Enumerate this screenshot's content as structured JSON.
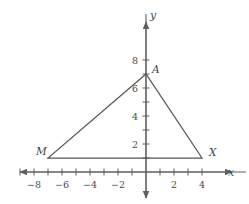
{
  "figure": {
    "axis_x_label": "x",
    "axis_y_label": "y",
    "line_color": "#5f5f5f",
    "shape_color": "#555555",
    "text_color": "#4a4a4a",
    "background": "#ffffff"
  },
  "chart_data": {
    "type": "scatter",
    "title": "",
    "xlabel": "x",
    "ylabel": "y",
    "xlim": [
      -9.5,
      5.5
    ],
    "ylim": [
      -1.5,
      9.5
    ],
    "grid": false,
    "legend": null,
    "x_ticks": [
      -9,
      -8,
      -7,
      -6,
      -5,
      -4,
      -3,
      -2,
      -1,
      1,
      2,
      3,
      4
    ],
    "y_ticks": [
      1,
      2,
      3,
      4,
      5,
      6,
      7,
      8
    ],
    "x_tick_labels": [
      {
        "value": -8,
        "text": "−8"
      },
      {
        "value": -6,
        "text": "−6"
      },
      {
        "value": -4,
        "text": "−4"
      },
      {
        "value": -2,
        "text": "−2"
      },
      {
        "value": 2,
        "text": "2"
      },
      {
        "value": 4,
        "text": "4"
      }
    ],
    "y_tick_labels": [
      {
        "value": 2,
        "text": "2"
      },
      {
        "value": 4,
        "text": "4"
      },
      {
        "value": 6,
        "text": "6"
      },
      {
        "value": 8,
        "text": "8"
      }
    ],
    "shape": "triangle",
    "points": [
      {
        "name": "A",
        "x": 0,
        "y": 7
      },
      {
        "name": "M",
        "x": -7,
        "y": 1
      },
      {
        "name": "X",
        "x": 4,
        "y": 1
      }
    ],
    "annotations": [
      {
        "text": "A",
        "x": 0,
        "y": 7
      },
      {
        "text": "M",
        "x": -7,
        "y": 1
      },
      {
        "text": "X",
        "x": 4,
        "y": 1
      }
    ]
  }
}
